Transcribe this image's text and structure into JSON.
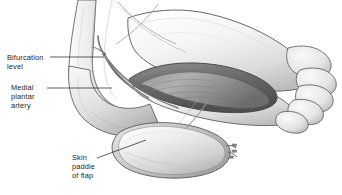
{
  "figure": {
    "modality": "grayscale medical line-and-wash illustration",
    "width": 342,
    "height": 195
  },
  "labels": [
    {
      "id": "bifurcation",
      "text": "Bifurcation\nlevel",
      "line1": "Bifurcation",
      "line2": "level",
      "leader": "horizontal line running right to the arterial bifurcation"
    },
    {
      "id": "medial-plantar-artery",
      "text": "Medial\nplantar\nartery",
      "line1": "Medial",
      "line2": "plantar",
      "line3": "artery",
      "leader": "horizontal line running right to the medial plantar artery"
    },
    {
      "id": "skin-paddle",
      "text": "Skin\npaddle\nof flap",
      "line1": "Skin",
      "line2": "paddle",
      "line3": "of flap",
      "leader": "short diagonal line running up-right onto the elliptical skin paddle"
    }
  ],
  "anatomy": {
    "structures": [
      "lower leg / ankle shaft",
      "heel",
      "plantar surface of foot",
      "toes",
      "opened plantar dissection cavity",
      "medial plantar artery pedicle",
      "arterial bifurcation",
      "elevated elliptical skin paddle",
      "vascular clips on pedicle stump",
      "crossing incision lines over the ankle"
    ]
  },
  "colors": {
    "background": "#ffffff",
    "outline": "#4b4b4b",
    "skin_light": "#f2f2f2",
    "skin_mid": "#d8d8d8",
    "skin_shadow": "#b4b4b4",
    "cavity_dark": "#6e6e6e",
    "cavity_deep": "#4a4a4a",
    "vessel": "#6d6d6d",
    "leader_line": "#2a2a2a",
    "text": "#1d1d1d"
  }
}
